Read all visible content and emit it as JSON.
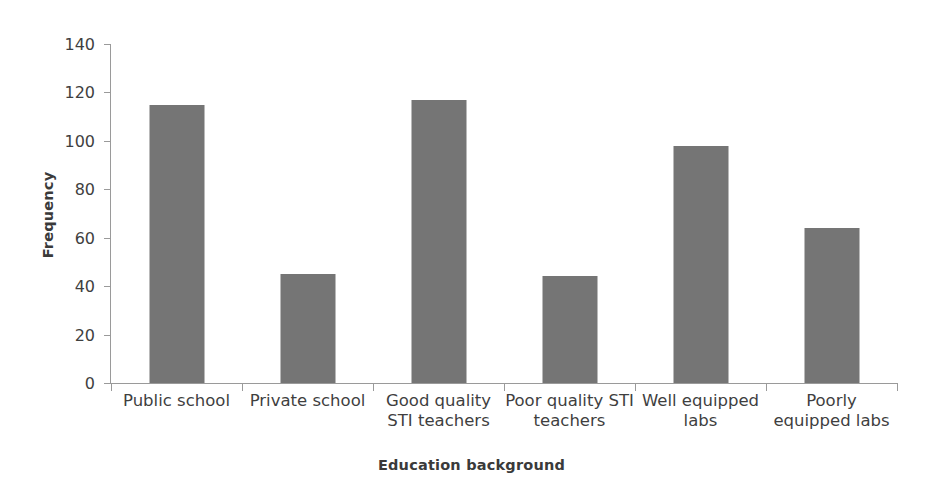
{
  "chart_data": {
    "type": "bar",
    "title": "",
    "xlabel": "Education background",
    "ylabel": "Frequency",
    "categories": [
      "Public school",
      "Private school",
      "Good quality STI teachers",
      "Poor quality STI teachers",
      "Well equipped labs",
      "Poorly equipped labs"
    ],
    "values": [
      115,
      45,
      117,
      44,
      98,
      64
    ],
    "ylim": [
      0,
      140
    ],
    "ytick_labels": [
      "0",
      "20",
      "40",
      "60",
      "80",
      "100",
      "120",
      "140"
    ],
    "ytick_values": [
      0,
      20,
      40,
      60,
      80,
      100,
      120,
      140
    ],
    "grid": false,
    "legend": false,
    "bar_color": "#757575",
    "axis_color": "#9a9a9a",
    "text_color": "#3f3f3f",
    "background": "#ffffff"
  }
}
